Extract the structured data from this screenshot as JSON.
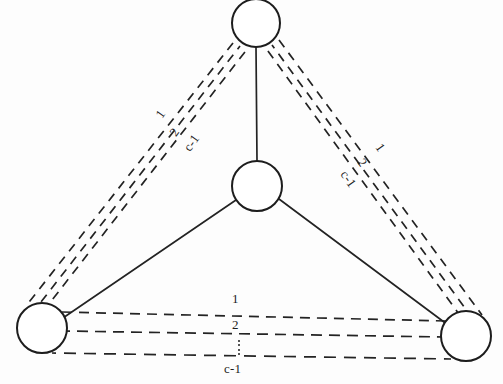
{
  "figure": {
    "kind": "node-link-multigraph",
    "background_color": "#fdfdfd",
    "stroke_color": "#1d1d1d",
    "width": 503,
    "height": 384
  },
  "nodes": [
    {
      "id": "top",
      "name": "node-top",
      "cx": 256,
      "cy": 23,
      "r": 24
    },
    {
      "id": "center",
      "name": "node-center",
      "cx": 257,
      "cy": 186,
      "r": 25
    },
    {
      "id": "bottom-left",
      "name": "node-bottom-left",
      "cx": 42,
      "cy": 328,
      "r": 25
    },
    {
      "id": "bottom-right",
      "name": "node-bottom-right",
      "cx": 466,
      "cy": 336,
      "r": 25
    }
  ],
  "solid_edges": [
    {
      "name": "edge-center-top",
      "from": "center",
      "to": "top"
    },
    {
      "name": "edge-center-bottom-left",
      "from": "center",
      "to": "bottom-left"
    },
    {
      "name": "edge-center-bottom-right",
      "from": "center",
      "to": "bottom-right"
    }
  ],
  "dashed_bundles": [
    {
      "name": "bundle-top-bottom-left",
      "from": "top",
      "to": "bottom-left",
      "count": 3,
      "labels": [
        "1",
        "2",
        "c-1"
      ],
      "label_positions": [
        {
          "text": "1",
          "x": 153,
          "y": 113,
          "rotate": -55
        },
        {
          "text": "2",
          "x": 167,
          "y": 131,
          "rotate": -55
        },
        {
          "text": "c-1",
          "x": 181,
          "y": 146,
          "rotate": -55
        }
      ]
    },
    {
      "name": "bundle-top-bottom-right",
      "from": "top",
      "to": "bottom-right",
      "count": 3,
      "labels": [
        "1",
        "2",
        "c-1"
      ],
      "label_positions": [
        {
          "text": "1",
          "x": 384,
          "y": 141,
          "rotate": 55
        },
        {
          "text": "2",
          "x": 366,
          "y": 156,
          "rotate": 55
        },
        {
          "text": "c-1",
          "x": 349,
          "y": 168,
          "rotate": 55
        }
      ]
    },
    {
      "name": "bundle-bottom-left-bottom-right",
      "from": "bottom-left",
      "to": "bottom-right",
      "count": 3,
      "labels": [
        "1",
        "2",
        "c-1"
      ],
      "label_positions": [
        {
          "text": "1",
          "x": 232,
          "y": 292,
          "rotate": 0
        },
        {
          "text": "2",
          "x": 232,
          "y": 318,
          "rotate": 0
        },
        {
          "text": "c-1",
          "x": 224,
          "y": 362,
          "rotate": 0
        }
      ]
    }
  ],
  "ellipsis": {
    "name": "vertical-ellipsis",
    "glyph": "vertical-dots",
    "x": 238,
    "y": 337,
    "dot_count": 4
  },
  "labels": {
    "one": "1",
    "two": "2",
    "c_minus_one": "c-1"
  }
}
